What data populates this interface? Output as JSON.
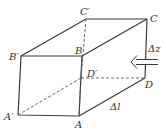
{
  "diagram": {
    "type": "rectangular prism (fluid element) with inflow arrow",
    "vertices": {
      "A": {
        "label": "A",
        "x": 79,
        "y": 116
      },
      "B": {
        "label": "B",
        "x": 82,
        "y": 56
      },
      "C": {
        "label": "C",
        "x": 147,
        "y": 19
      },
      "D": {
        "label": "D",
        "x": 145,
        "y": 78
      },
      "A_prime": {
        "label": "A′",
        "x": 18,
        "y": 115
      },
      "B_prime": {
        "label": "B′",
        "x": 21,
        "y": 56
      },
      "C_prime": {
        "label": "C′",
        "x": 86,
        "y": 19
      },
      "D_prime": {
        "label": "D′",
        "x": 81,
        "y": 78
      }
    },
    "labels": {
      "A": "A",
      "B": "B",
      "C": "C",
      "D": "D",
      "A_prime": "A′",
      "B_prime": "B′",
      "C_prime": "C′",
      "D_prime": "D′",
      "delta_z": "Δz",
      "delta_l": "Δl"
    },
    "arrow": {
      "direction": "left",
      "style": "double-line hollow arrow"
    },
    "colors": {
      "stroke": "#3a3a3a",
      "background": "#ffffff"
    }
  }
}
